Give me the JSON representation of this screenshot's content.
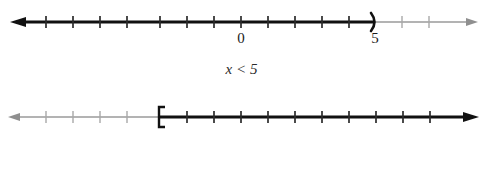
{
  "figure": {
    "background_color": "#ffffff",
    "shaded_color": "#111111",
    "unshaded_color": "#9a9a9a",
    "tick_color_shaded": "#111111",
    "tick_color_unshaded": "#a8a8a8"
  },
  "number_lines": [
    {
      "id": "number-line-1",
      "caption": "x < 5",
      "variable": "x",
      "relation": "<",
      "boundary_value": 5,
      "endpoint_style": "open-parenthesis",
      "endpoint_glyph": ")",
      "shaded_direction": "left",
      "axis_min": -7.6,
      "axis_max": 7.6,
      "tick_values": [
        -7,
        -6,
        -5,
        -4,
        -3,
        -2,
        -1,
        0,
        1,
        2,
        3,
        4,
        5,
        6,
        7
      ],
      "labels": [
        {
          "name": "zero",
          "text": "0",
          "value": 0
        },
        {
          "name": "five",
          "text": "5",
          "value": 5
        }
      ],
      "left_arrow": "filled-bold",
      "right_arrow": "filled-thin"
    },
    {
      "id": "number-line-2",
      "caption": "x ≥ –3",
      "variable": "x",
      "relation": "≥",
      "boundary_value": -3,
      "endpoint_style": "closed-bracket",
      "endpoint_glyph": "[",
      "shaded_direction": "right",
      "axis_min": -7.6,
      "axis_max": 7.6,
      "tick_values": [
        -7,
        -6,
        -5,
        -4,
        -3,
        -2,
        -1,
        0,
        1,
        2,
        3,
        4,
        5,
        6,
        7
      ],
      "labels": [
        {
          "name": "neg-three",
          "text": "–3",
          "value": -3
        },
        {
          "name": "zero",
          "text": "0",
          "value": 0
        }
      ],
      "left_arrow": "filled-thin",
      "right_arrow": "filled-bold"
    }
  ]
}
